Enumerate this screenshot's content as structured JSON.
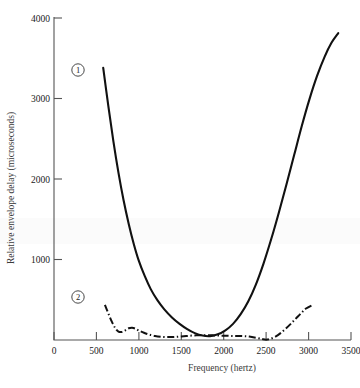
{
  "chart_data": {
    "type": "line",
    "title": "",
    "xlabel": "Frequency (hertz)",
    "ylabel": "Relative envelope delay (microseconds)",
    "xlim": [
      0,
      3500
    ],
    "ylim": [
      0,
      4000
    ],
    "xticks": [
      0,
      500,
      1000,
      1500,
      2000,
      2500,
      3000,
      3500
    ],
    "xtick_labels": [
      "0",
      "500",
      "1000",
      "1500",
      "2000",
      "2500",
      "3000",
      "3500"
    ],
    "yticks": [
      1000,
      2000,
      3000,
      4000
    ],
    "ytick_labels": [
      "1000",
      "2000",
      "3000",
      "4000"
    ],
    "grid": false,
    "legend": "inline-circled-numbers",
    "series": [
      {
        "name": "1",
        "label": "①",
        "style": "solid",
        "color": "#111111",
        "points": [
          [
            580,
            3370
          ],
          [
            640,
            2900
          ],
          [
            700,
            2460
          ],
          [
            760,
            2070
          ],
          [
            820,
            1730
          ],
          [
            880,
            1440
          ],
          [
            940,
            1190
          ],
          [
            1000,
            980
          ],
          [
            1070,
            790
          ],
          [
            1140,
            630
          ],
          [
            1220,
            490
          ],
          [
            1300,
            380
          ],
          [
            1390,
            280
          ],
          [
            1480,
            200
          ],
          [
            1570,
            135
          ],
          [
            1660,
            85
          ],
          [
            1750,
            55
          ],
          [
            1840,
            48
          ],
          [
            1930,
            70
          ],
          [
            2020,
            120
          ],
          [
            2110,
            200
          ],
          [
            2200,
            320
          ],
          [
            2290,
            480
          ],
          [
            2380,
            690
          ],
          [
            2470,
            950
          ],
          [
            2560,
            1250
          ],
          [
            2650,
            1580
          ],
          [
            2740,
            1930
          ],
          [
            2830,
            2290
          ],
          [
            2920,
            2650
          ],
          [
            3010,
            2980
          ],
          [
            3100,
            3270
          ],
          [
            3190,
            3510
          ],
          [
            3270,
            3680
          ],
          [
            3350,
            3800
          ]
        ]
      },
      {
        "name": "2",
        "label": "②",
        "style": "dash-dot",
        "color": "#111111",
        "points": [
          [
            600,
            435
          ],
          [
            640,
            330
          ],
          [
            680,
            230
          ],
          [
            720,
            150
          ],
          [
            760,
            105
          ],
          [
            800,
            100
          ],
          [
            840,
            120
          ],
          [
            880,
            145
          ],
          [
            920,
            152
          ],
          [
            960,
            140
          ],
          [
            1000,
            118
          ],
          [
            1060,
            90
          ],
          [
            1120,
            68
          ],
          [
            1190,
            50
          ],
          [
            1260,
            40
          ],
          [
            1340,
            36
          ],
          [
            1420,
            38
          ],
          [
            1500,
            44
          ],
          [
            1590,
            52
          ],
          [
            1680,
            58
          ],
          [
            1770,
            60
          ],
          [
            1860,
            58
          ],
          [
            1950,
            55
          ],
          [
            2040,
            52
          ],
          [
            2130,
            50
          ],
          [
            2220,
            48
          ],
          [
            2300,
            42
          ],
          [
            2380,
            28
          ],
          [
            2450,
            12
          ],
          [
            2500,
            4
          ],
          [
            2550,
            14
          ],
          [
            2610,
            42
          ],
          [
            2670,
            85
          ],
          [
            2730,
            140
          ],
          [
            2790,
            200
          ],
          [
            2850,
            265
          ],
          [
            2910,
            330
          ],
          [
            2970,
            390
          ],
          [
            3050,
            435
          ]
        ]
      }
    ],
    "annotations": [
      {
        "text": "1",
        "shape": "circled",
        "x_px": 78,
        "y_px": 70
      },
      {
        "text": "2",
        "shape": "circled",
        "x_px": 78,
        "y_px": 297
      }
    ]
  },
  "colors": {
    "background": "#ffffff",
    "axis": "#555555",
    "curve": "#111111",
    "axis_title": "#3a3a3a"
  }
}
